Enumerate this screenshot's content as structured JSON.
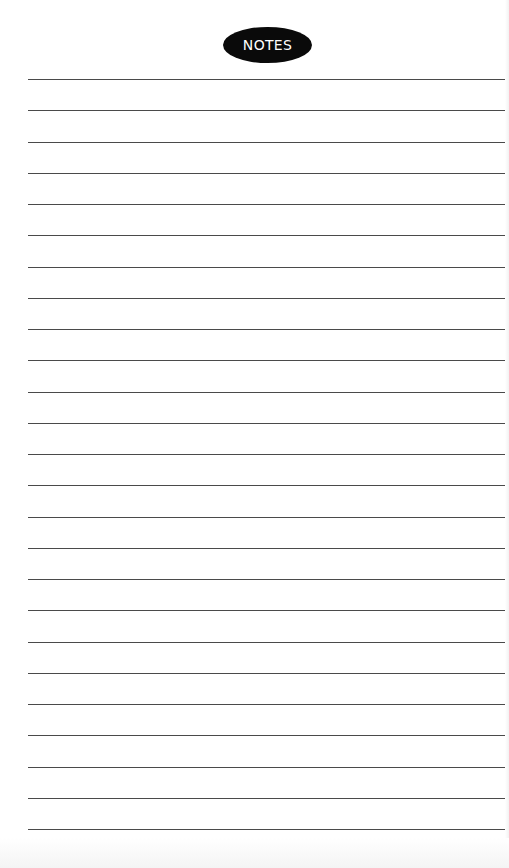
{
  "page": {
    "title": "NOTES",
    "background_color": "#ffffff",
    "badge_color": "#0a0a0a",
    "badge_text_color": "#ffffff",
    "line_color": "#4a4a4a"
  },
  "lines": {
    "count": 25,
    "first_y": 79,
    "spacing": 31.25,
    "left": 28,
    "right": 505
  }
}
